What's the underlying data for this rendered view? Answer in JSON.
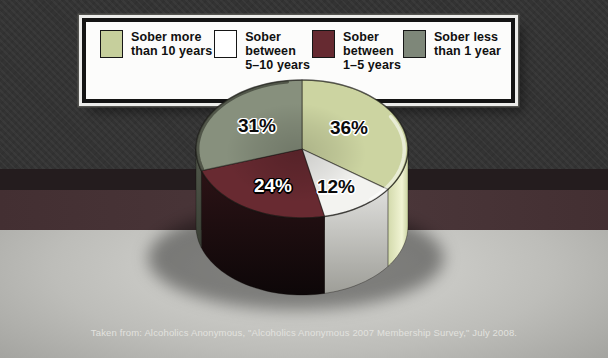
{
  "chart_data": {
    "type": "pie",
    "style": "3d-cylinder",
    "title": "",
    "direction": "clockwise",
    "start_angle_deg": 0,
    "legend_position": "top",
    "segments": [
      {
        "label": "Sober more than 10 years",
        "value": 36,
        "pct_label": "36%",
        "color_top": "#ccd4a1",
        "color_side": "#c4cd98",
        "color_side_dark": "#98a374",
        "color_shine": "#f1f4d4"
      },
      {
        "label": "Sober between 5–10 years",
        "value": 12,
        "pct_label": "12%",
        "color_top": "#f3f3f0",
        "color_side": "#ececea",
        "color_side_dark": "#9d9d97"
      },
      {
        "label": "Sober between 1–5 years",
        "value": 24,
        "pct_label": "24%",
        "color_top": "#682a31",
        "color_side": "#2c1316",
        "color_side_dark": "#0d0708"
      },
      {
        "label": "Sober less than 1 year",
        "value": 31,
        "pct_label": "31%",
        "color_top": "#87907d",
        "color_side": "#4d5347",
        "color_side_dark": "#2e322a"
      }
    ]
  },
  "legend": {
    "items": [
      {
        "lines": [
          "Sober more",
          "than 10 years"
        ],
        "swatch_color": "#c6cf9c"
      },
      {
        "lines": [
          "Sober",
          "between",
          "5–10 years"
        ],
        "swatch_color": "#ffffff"
      },
      {
        "lines": [
          "Sober",
          "between",
          "1–5 years"
        ],
        "swatch_color": "#662a31"
      },
      {
        "lines": [
          "Sober less",
          "than 1 year"
        ],
        "swatch_color": "#7e8779"
      }
    ]
  },
  "caption": "Taken from: Alcoholics Anonymous, \"Alcoholics Anonymous 2007 Membership Survey,\" July 2008.",
  "palette": {
    "bg-top": "#73736d",
    "bg-top-dark": "#5e5e59",
    "band-thin": "#241c1e",
    "band-maroon": "#432f32",
    "bg-bottom-light": "#dadad6",
    "bg-bottom-mid": "#bdbdb9",
    "bg-bottom-dark": "#9b9b97",
    "caption-color": "#e2e2df",
    "legend-border": "#141414"
  }
}
